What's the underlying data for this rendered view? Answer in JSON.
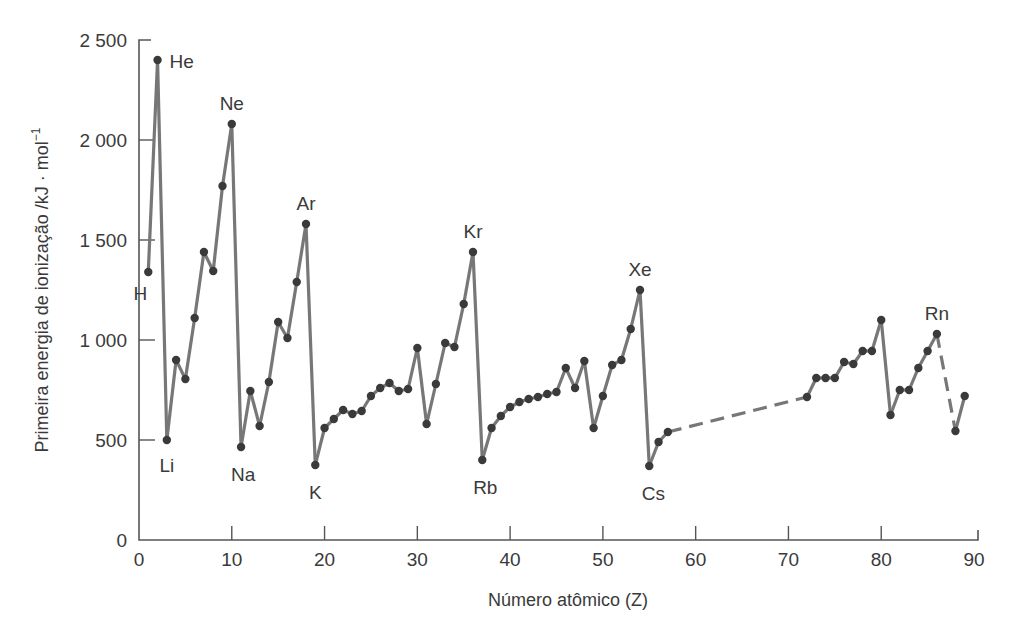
{
  "chart_data": {
    "type": "line",
    "title": "",
    "xlabel": "Número atômico (Z)",
    "ylabel": "Primeira energia de ionização /kJ · mol⁻¹",
    "xlim": [
      0,
      90
    ],
    "ylim": [
      0,
      2500
    ],
    "grid": false,
    "x_ticks": [
      0,
      10,
      20,
      30,
      40,
      50,
      60,
      70,
      80,
      90
    ],
    "y_ticks": [
      0,
      500,
      1000,
      1500,
      2000,
      2500
    ],
    "y_tick_labels": [
      "0",
      "500",
      "1 000",
      "1 500",
      "2 000",
      "2 500"
    ],
    "series": [
      {
        "name": "Primeira energia de ionização",
        "points": [
          [
            1,
            1340
          ],
          [
            2,
            2400
          ],
          [
            3,
            500
          ],
          [
            4,
            900
          ],
          [
            5,
            805
          ],
          [
            6,
            1110
          ],
          [
            7,
            1440
          ],
          [
            8,
            1345
          ],
          [
            9,
            1770
          ],
          [
            10,
            2080
          ],
          [
            11,
            465
          ],
          [
            12,
            745
          ],
          [
            13,
            570
          ],
          [
            14,
            790
          ],
          [
            15,
            1090
          ],
          [
            16,
            1010
          ],
          [
            17,
            1290
          ],
          [
            18,
            1580
          ],
          [
            19,
            375
          ],
          [
            20,
            560
          ],
          [
            21,
            605
          ],
          [
            22,
            650
          ],
          [
            23,
            630
          ],
          [
            24,
            645
          ],
          [
            25,
            720
          ],
          [
            26,
            760
          ],
          [
            27,
            785
          ],
          [
            28,
            745
          ],
          [
            29,
            755
          ],
          [
            30,
            960
          ],
          [
            31,
            580
          ],
          [
            32,
            780
          ],
          [
            33,
            985
          ],
          [
            34,
            965
          ],
          [
            35,
            1180
          ],
          [
            36,
            1440
          ],
          [
            37,
            400
          ],
          [
            38,
            560
          ],
          [
            39,
            620
          ],
          [
            40,
            665
          ],
          [
            41,
            690
          ],
          [
            42,
            705
          ],
          [
            43,
            715
          ],
          [
            44,
            730
          ],
          [
            45,
            740
          ],
          [
            46,
            860
          ],
          [
            47,
            760
          ],
          [
            48,
            895
          ],
          [
            49,
            560
          ],
          [
            50,
            720
          ],
          [
            51,
            875
          ],
          [
            52,
            900
          ],
          [
            53,
            1055
          ],
          [
            54,
            1250
          ],
          [
            55,
            370
          ],
          [
            56,
            490
          ],
          [
            57,
            540
          ],
          [
            72,
            715
          ],
          [
            73,
            810
          ],
          [
            74,
            810
          ],
          [
            75,
            810
          ],
          [
            76,
            890
          ],
          [
            77,
            880
          ],
          [
            78,
            945
          ],
          [
            79,
            945
          ],
          [
            80,
            1100
          ],
          [
            81,
            625
          ],
          [
            82,
            750
          ],
          [
            83,
            750
          ],
          [
            84,
            860
          ],
          [
            85,
            945
          ],
          [
            86,
            1030
          ],
          [
            88,
            545
          ],
          [
            89,
            720
          ]
        ],
        "dashed_segments": [
          [
            57,
            72
          ],
          [
            86,
            88
          ]
        ]
      }
    ],
    "annotations": [
      {
        "label": "H",
        "z": 1
      },
      {
        "label": "He",
        "z": 2
      },
      {
        "label": "Li",
        "z": 3
      },
      {
        "label": "Ne",
        "z": 10
      },
      {
        "label": "Na",
        "z": 11
      },
      {
        "label": "Ar",
        "z": 18
      },
      {
        "label": "K",
        "z": 19
      },
      {
        "label": "Kr",
        "z": 36
      },
      {
        "label": "Rb",
        "z": 37
      },
      {
        "label": "Xe",
        "z": 54
      },
      {
        "label": "Cs",
        "z": 55
      },
      {
        "label": "Rn",
        "z": 86
      }
    ]
  },
  "colors": {
    "line": "#777777",
    "marker": "#3a3a3a",
    "axis": "#555555",
    "text": "#3a3a3a"
  },
  "axes": {
    "xlabel": "Número atômico (Z)",
    "ylabel_main": "Primeira energia de ionização /kJ · mol",
    "ylabel_sup": "−1"
  }
}
